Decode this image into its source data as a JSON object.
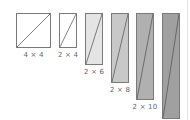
{
  "figure": {
    "shapes": [
      {
        "label": "4 × 4",
        "x": 16,
        "y": 13,
        "w": 35,
        "h": 35,
        "fill": "#ffffff",
        "label_y": 51
      },
      {
        "label": "2 × 4",
        "x": 59,
        "y": 13,
        "w": 18,
        "h": 35,
        "fill": "#ffffff",
        "label_y": 51
      },
      {
        "label": "2 × 6",
        "x": 85,
        "y": 13,
        "w": 18,
        "h": 52,
        "fill": "#e4e4e4",
        "label_y": 68
      },
      {
        "label": "2 × 8",
        "x": 111,
        "y": 13,
        "w": 18,
        "h": 70,
        "fill": "#c8c8c8",
        "label_y": 86
      },
      {
        "label": "2 × 10",
        "x": 136,
        "y": 13,
        "w": 18,
        "h": 87,
        "fill": "#b0b0b0",
        "label_y": 103
      },
      {
        "label": "",
        "x": 162,
        "y": 13,
        "w": 18,
        "h": 106,
        "fill": "#a0a0a0",
        "label_y": null
      }
    ],
    "colors": {
      "stroke": "#7a7a7a",
      "diagonal": "#555555",
      "label": "#666666"
    }
  }
}
